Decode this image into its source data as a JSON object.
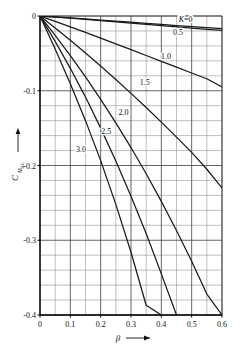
{
  "chart_data": {
    "type": "line",
    "title": "",
    "subtitle": "",
    "xlabel": "β",
    "ylabel": "C_Mac",
    "ylabel_main": "C",
    "ylabel_sub": "M",
    "ylabel_sub2": "a.c.",
    "xlim": [
      0,
      0.6
    ],
    "ylim": [
      -0.4,
      0
    ],
    "grid": true,
    "grid_major_x": 0.1,
    "grid_minor_x": 0.05,
    "grid_major_y": 0.1,
    "grid_minor_y": 0.02,
    "legend_position": "inline-curve-labels",
    "xticks": [
      0,
      0.1,
      0.2,
      0.3,
      0.4,
      0.5,
      0.6
    ],
    "xticklabels": [
      "0",
      "0.1",
      "0.2",
      "0.3",
      "0.4",
      "0.5",
      "0.6"
    ],
    "yticks": [
      0,
      -0.1,
      -0.2,
      -0.3,
      -0.4
    ],
    "yticklabels": [
      "0",
      "-0.1",
      "-0.2",
      "-0.3",
      "-0.4"
    ],
    "x": [
      0,
      0.05,
      0.1,
      0.15,
      0.2,
      0.25,
      0.3,
      0.35,
      0.4,
      0.45,
      0.5,
      0.55,
      0.6
    ],
    "series": [
      {
        "name": "K=0",
        "label": "K=0",
        "label_x": 0.48,
        "label_y": -0.008,
        "values": [
          0,
          -0.0013,
          -0.0026,
          -0.004,
          -0.0054,
          -0.0068,
          -0.0083,
          -0.0098,
          -0.0113,
          -0.0128,
          -0.0143,
          -0.0157,
          -0.017
        ]
      },
      {
        "name": "K=0.5",
        "label": "0.5",
        "label_x": 0.455,
        "label_y": -0.0255,
        "values": [
          0,
          -0.0015,
          -0.003,
          -0.0046,
          -0.0062,
          -0.0079,
          -0.0096,
          -0.0113,
          -0.013,
          -0.0147,
          -0.0163,
          -0.0178,
          -0.0192
        ]
      },
      {
        "name": "K=1.0",
        "label": "1.0",
        "label_x": 0.415,
        "label_y": -0.057,
        "values": [
          0,
          -0.0072,
          -0.0145,
          -0.022,
          -0.0296,
          -0.0373,
          -0.045,
          -0.0528,
          -0.0606,
          -0.0684,
          -0.0762,
          -0.084,
          -0.095
        ]
      },
      {
        "name": "K=1.5",
        "label": "1.5",
        "label_x": 0.345,
        "label_y": -0.092,
        "values": [
          0,
          -0.016,
          -0.0325,
          -0.0495,
          -0.067,
          -0.085,
          -0.1035,
          -0.1225,
          -0.142,
          -0.162,
          -0.1825,
          -0.205,
          -0.23
        ]
      },
      {
        "name": "K=2.0",
        "label": "2.0",
        "label_x": 0.275,
        "label_y": -0.132,
        "values": [
          0,
          -0.026,
          -0.053,
          -0.0815,
          -0.1115,
          -0.143,
          -0.176,
          -0.211,
          -0.248,
          -0.287,
          -0.328,
          -0.372,
          -0.4
        ]
      },
      {
        "name": "K=2.5",
        "label": "2.5",
        "label_x": 0.218,
        "label_y": -0.158,
        "values": [
          0,
          -0.034,
          -0.07,
          -0.1085,
          -0.15,
          -0.194,
          -0.241,
          -0.291,
          -0.345,
          -0.4,
          -0.4,
          -0.4,
          -0.4
        ]
      },
      {
        "name": "K=3.0",
        "label": "3.0",
        "label_x": 0.135,
        "label_y": -0.182,
        "values": [
          0,
          -0.044,
          -0.0905,
          -0.14,
          -0.1935,
          -0.252,
          -0.316,
          -0.387,
          -0.4,
          -0.4,
          -0.4,
          -0.4,
          -0.4
        ]
      }
    ],
    "colors": {
      "curve": "#1a1a1a",
      "grid_minor": "#8a8a8a",
      "grid_major": "#4a4a4a",
      "axis": "#000000",
      "background": "#ffffff"
    }
  }
}
